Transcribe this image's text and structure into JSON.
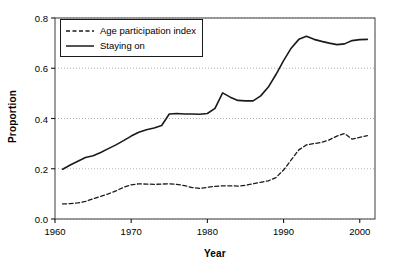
{
  "chart_data": {
    "type": "line",
    "title": "",
    "xlabel": "Year",
    "ylabel": "Proportion",
    "xlim": [
      1960,
      2002
    ],
    "ylim": [
      0.0,
      0.8
    ],
    "grid": true,
    "grid_style": "dotted-horizontal",
    "legend_position": "upper-left",
    "xticks": [
      1960,
      1970,
      1980,
      1990,
      2000
    ],
    "xtick_labels": [
      "1960",
      "1970",
      "1980",
      "1990",
      "2000"
    ],
    "yticks": [
      0.0,
      0.2,
      0.4,
      0.6,
      0.8
    ],
    "ytick_labels": [
      "0.0",
      "0.2",
      "0.4",
      "0.6",
      "0.8"
    ],
    "x": [
      1961,
      1962,
      1963,
      1964,
      1965,
      1966,
      1967,
      1968,
      1969,
      1970,
      1971,
      1972,
      1973,
      1974,
      1975,
      1976,
      1977,
      1978,
      1979,
      1980,
      1981,
      1982,
      1983,
      1984,
      1985,
      1986,
      1987,
      1988,
      1989,
      1990,
      1991,
      1992,
      1993,
      1994,
      1995,
      1996,
      1997,
      1998,
      1999,
      2000,
      2001
    ],
    "series": [
      {
        "name": "Age participation index",
        "style": "dashed",
        "color": "#1a1a1a",
        "values": [
          0.06,
          0.061,
          0.064,
          0.07,
          0.08,
          0.09,
          0.1,
          0.112,
          0.126,
          0.136,
          0.14,
          0.139,
          0.138,
          0.139,
          0.14,
          0.138,
          0.133,
          0.125,
          0.122,
          0.126,
          0.13,
          0.132,
          0.132,
          0.131,
          0.134,
          0.14,
          0.146,
          0.152,
          0.165,
          0.195,
          0.235,
          0.275,
          0.295,
          0.3,
          0.305,
          0.315,
          0.33,
          0.34,
          0.318,
          0.325,
          0.332
        ]
      },
      {
        "name": "Staying on",
        "style": "solid",
        "color": "#1a1a1a",
        "values": [
          0.198,
          0.215,
          0.23,
          0.245,
          0.252,
          0.265,
          0.28,
          0.295,
          0.312,
          0.33,
          0.345,
          0.355,
          0.362,
          0.372,
          0.418,
          0.42,
          0.418,
          0.418,
          0.417,
          0.42,
          0.44,
          0.502,
          0.485,
          0.472,
          0.47,
          0.47,
          0.49,
          0.525,
          0.575,
          0.63,
          0.68,
          0.715,
          0.727,
          0.715,
          0.707,
          0.7,
          0.694,
          0.697,
          0.71,
          0.714,
          0.715
        ]
      }
    ]
  }
}
